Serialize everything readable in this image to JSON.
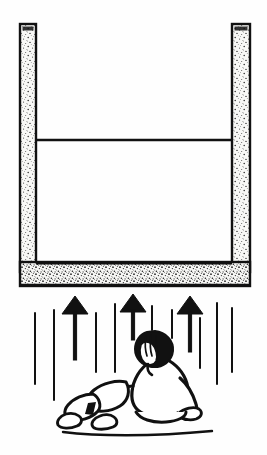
{
  "image": {
    "title": "Seated person beneath concrete channel with upward airflow arrows",
    "width": 267,
    "height": 455,
    "style": "black and white line drawing / stippled halftone illustration",
    "background_color": "#fefefe",
    "ink_color": "#111111"
  },
  "scene": {
    "structure": {
      "name": "concrete U-shaped channel",
      "texture": "stippled concrete speckle",
      "outline_color": "#111111",
      "fill_color": "#f7f7f5",
      "left_wall": {
        "x": 20,
        "y": 24,
        "width": 16,
        "height": 248
      },
      "right_wall": {
        "x": 232,
        "y": 24,
        "width": 18,
        "height": 248
      },
      "floor_slab": {
        "x": 20,
        "y": 262,
        "width": 230,
        "height": 24
      },
      "interior_divider_line": {
        "x1": 36,
        "y1": 140,
        "x2": 232,
        "y2": 140,
        "thickness": 2
      }
    },
    "arrows": {
      "name": "upward airflow arrows",
      "count": 3,
      "color": "#111111",
      "items": [
        {
          "x": 75,
          "head_top": 296,
          "head_bottom": 314,
          "half_width": 13,
          "stem_bottom": 360
        },
        {
          "x": 133,
          "head_top": 294,
          "head_bottom": 312,
          "half_width": 13,
          "stem_bottom": 340
        },
        {
          "x": 190,
          "head_top": 296,
          "head_bottom": 314,
          "half_width": 13,
          "stem_bottom": 352
        }
      ]
    },
    "streaks": {
      "name": "vertical rain streak marks",
      "color": "#111111",
      "thickness": 2,
      "items": [
        {
          "x": 35,
          "y1": 313,
          "y2": 384
        },
        {
          "x": 54,
          "y1": 310,
          "y2": 400
        },
        {
          "x": 96,
          "y1": 313,
          "y2": 372
        },
        {
          "x": 115,
          "y1": 304,
          "y2": 372
        },
        {
          "x": 152,
          "y1": 306,
          "y2": 330
        },
        {
          "x": 172,
          "y1": 310,
          "y2": 338
        },
        {
          "x": 200,
          "y1": 318,
          "y2": 368
        },
        {
          "x": 217,
          "y1": 303,
          "y2": 384
        },
        {
          "x": 232,
          "y1": 308,
          "y2": 372
        }
      ]
    },
    "figure": {
      "name": "seated person",
      "description": "person sitting on the ground, seen from behind, hand raised to head, legs bent to the left",
      "outline_color": "#111111",
      "hair_color": "#111111",
      "skin_fill": "#ffffff",
      "parts": [
        "head",
        "hair",
        "hand-on-head",
        "torso",
        "left-arm",
        "right-arm",
        "legs",
        "feet"
      ]
    },
    "ground_line": {
      "x1": 63,
      "y1": 432,
      "x2": 212,
      "y2": 432
    }
  }
}
